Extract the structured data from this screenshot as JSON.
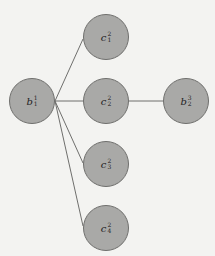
{
  "diagram": {
    "background": "#f3f3f1",
    "node_fill": "#a9a9a7",
    "node_stroke": "#6f6f6d",
    "edge_color": "#6f6f6d",
    "nodes": [
      {
        "id": "b11",
        "base": "b",
        "sup": "1",
        "sub": "1",
        "cx": 32,
        "cy": 101
      },
      {
        "id": "c21",
        "base": "c",
        "sup": "2",
        "sub": "1",
        "cx": 106,
        "cy": 37
      },
      {
        "id": "c22",
        "base": "c",
        "sup": "2",
        "sub": "2",
        "cx": 106,
        "cy": 101
      },
      {
        "id": "b32",
        "base": "b",
        "sup": "3",
        "sub": "2",
        "cx": 186,
        "cy": 101
      },
      {
        "id": "c23",
        "base": "c",
        "sup": "2",
        "sub": "3",
        "cx": 106,
        "cy": 164
      },
      {
        "id": "c24",
        "base": "c",
        "sup": "2",
        "sub": "4",
        "cx": 106,
        "cy": 228
      }
    ],
    "edges": [
      {
        "from": "b11",
        "to": "c21"
      },
      {
        "from": "b11",
        "to": "c22"
      },
      {
        "from": "b11",
        "to": "c23"
      },
      {
        "from": "b11",
        "to": "c24"
      },
      {
        "from": "c22",
        "to": "b32"
      }
    ]
  }
}
